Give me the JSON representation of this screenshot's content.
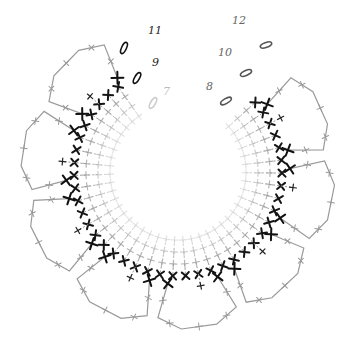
{
  "diagram": {
    "type": "crochet-chart",
    "row_labels": [
      {
        "text": "12",
        "x": 232,
        "y": 24,
        "tone": "mid"
      },
      {
        "text": "11",
        "x": 148,
        "y": 34,
        "tone": "dark"
      },
      {
        "text": "10",
        "x": 218,
        "y": 56,
        "tone": "mid"
      },
      {
        "text": "9",
        "x": 152,
        "y": 66,
        "tone": "dark"
      },
      {
        "text": "8",
        "x": 206,
        "y": 90,
        "tone": "mid"
      },
      {
        "text": "7",
        "x": 163,
        "y": 95,
        "tone": "faint"
      }
    ],
    "chain_ovals": [
      {
        "x": 124,
        "y": 48,
        "rot": -65,
        "color": "#111"
      },
      {
        "x": 266,
        "y": 45,
        "rot": -20,
        "color": "#555"
      },
      {
        "x": 137,
        "y": 78,
        "rot": -60,
        "color": "#111"
      },
      {
        "x": 246,
        "y": 73,
        "rot": -25,
        "color": "#555"
      },
      {
        "x": 226,
        "y": 101,
        "rot": -30,
        "color": "#555"
      },
      {
        "x": 153,
        "y": 103,
        "rot": -60,
        "color": "#ccc"
      }
    ],
    "center": {
      "x": 178,
      "y": 172,
      "inner_radius": 62
    },
    "petal_count": 8,
    "legend": {
      "stitch_symbol": "+",
      "stitch_name": "single crochet",
      "chain_symbol": "oval"
    }
  }
}
